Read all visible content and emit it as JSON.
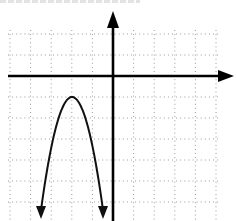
{
  "chart_data": {
    "type": "line",
    "title": "",
    "xlabel": "",
    "ylabel": "",
    "grid": true,
    "grid_style": "dotted",
    "xlim": [
      -5,
      5
    ],
    "ylim": [
      -7,
      2
    ],
    "axes": {
      "x_arrow": "right",
      "y_arrow": "up"
    },
    "series": [
      {
        "name": "parabola",
        "shape": "downward-opening parabola",
        "vertex": [
          -2,
          -1
        ],
        "endpoints_arrowed": true,
        "x": [
          -3.5,
          -3,
          -2.5,
          -2,
          -1.5,
          -1,
          -0.5
        ],
        "y": [
          -7,
          -3.4,
          -1.6,
          -1,
          -1.6,
          -3.4,
          -7
        ]
      }
    ]
  },
  "layout": {
    "origin_px": [
      113,
      76
    ],
    "unit_px": 20.6,
    "grid_x_px": [
      10,
      30.6,
      51.2,
      71.8,
      92.4,
      133.6,
      154.2,
      174.8,
      195.4,
      216
    ],
    "grid_y_px": [
      34,
      55,
      97,
      118,
      139,
      160,
      181,
      202
    ],
    "colors": {
      "axis": "#000000",
      "curve": "#111111",
      "grid": "#9a9a9a",
      "background": "#ffffff"
    }
  }
}
